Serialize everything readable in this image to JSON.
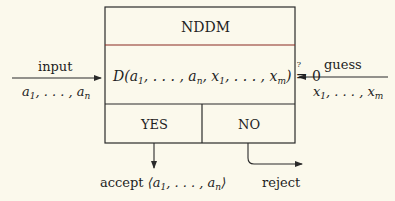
{
  "diagram": {
    "title": "NDDM",
    "equation": {
      "prefix": "D(",
      "args": [
        "a",
        "1",
        "a",
        "n",
        "x",
        "1",
        "x",
        "m"
      ],
      "relation": "?=",
      "rhs": "0"
    },
    "equation_text": "D(a1, ..., an, x1, ..., xm) ?= 0",
    "outcomes": {
      "yes": "YES",
      "no": "NO"
    },
    "input": {
      "label": "input",
      "values": "a1, ..., an"
    },
    "guess": {
      "label": "guess",
      "values": "x1, ..., xm"
    },
    "accept": {
      "label": "accept",
      "values": "⟨a1, ..., an⟩"
    },
    "reject": {
      "label": "reject"
    },
    "colors": {
      "background": "#fbf9ec",
      "line": "#2a2a2a",
      "accent_line": "#8a2a20"
    }
  }
}
